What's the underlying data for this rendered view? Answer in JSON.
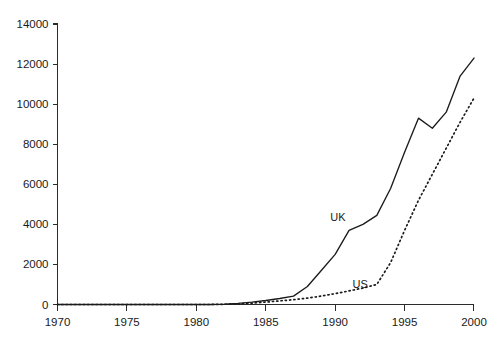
{
  "chart_data": {
    "type": "line",
    "title": "",
    "subtitle": "",
    "xlabel": "",
    "ylabel": "",
    "xlim": [
      1970,
      2000
    ],
    "ylim": [
      0,
      14000
    ],
    "xticks": [
      1970,
      1975,
      1980,
      1985,
      1990,
      1995,
      2000
    ],
    "xtick_labels": [
      "1970",
      "1975",
      "1980",
      "1985",
      "1990",
      "1995",
      "2000"
    ],
    "yticks": [
      0,
      2000,
      4000,
      6000,
      8000,
      10000,
      12000,
      14000
    ],
    "ytick_labels": [
      "0",
      "2000",
      "4000",
      "6000",
      "8000",
      "10000",
      "12000",
      "14000"
    ],
    "grid": false,
    "legend_position": "inline-annotations",
    "x": [
      1970,
      1971,
      1972,
      1973,
      1974,
      1975,
      1976,
      1977,
      1978,
      1979,
      1980,
      1981,
      1982,
      1983,
      1984,
      1985,
      1986,
      1987,
      1988,
      1989,
      1990,
      1991,
      1992,
      1993,
      1994,
      1995,
      1996,
      1997,
      1998,
      1999,
      2000
    ],
    "series": [
      {
        "name": "UK",
        "style": "solid",
        "color": "#1b1b1b",
        "label_x": 1990.2,
        "label_y": 4150,
        "values": [
          0,
          0,
          0,
          0,
          0,
          0,
          0,
          0,
          0,
          0,
          0,
          0,
          20,
          60,
          120,
          200,
          300,
          420,
          900,
          1700,
          2500,
          3700,
          4000,
          4450,
          5800,
          7600,
          9300,
          8800,
          9600,
          11400,
          12300
        ]
      },
      {
        "name": "US",
        "style": "dotted",
        "color": "#1b1b1b",
        "label_x": 1991.8,
        "label_y": 800,
        "values": [
          0,
          0,
          0,
          0,
          0,
          0,
          0,
          0,
          0,
          0,
          0,
          0,
          10,
          30,
          70,
          120,
          180,
          240,
          320,
          420,
          540,
          680,
          820,
          1000,
          2100,
          3700,
          5200,
          6500,
          7800,
          9100,
          10300
        ]
      }
    ],
    "annotations": [
      {
        "text": "UK",
        "x": 1990.2,
        "y": 4150
      },
      {
        "text": "US",
        "x": 1991.8,
        "y": 800
      }
    ]
  }
}
